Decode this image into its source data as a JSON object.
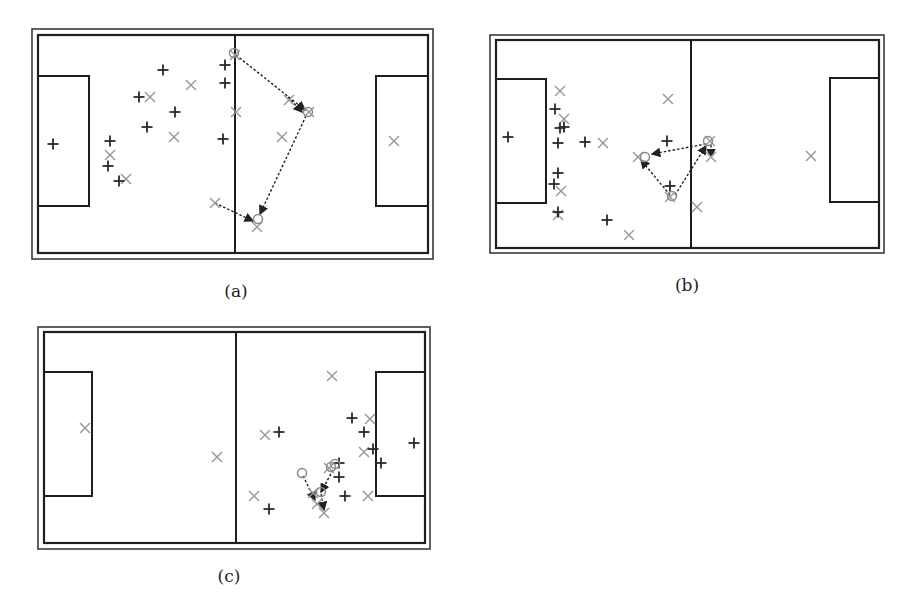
{
  "colors": {
    "frame": "#3a3a3a",
    "line": "#1e1e1e",
    "team_plus": "#2a2a2a",
    "team_x": "#9a9a9a",
    "ball_circle": "#8a8a8a",
    "arrow": "#222222"
  },
  "panels": [
    {
      "id": "a",
      "caption": "(a)",
      "caption_pos": [
        236,
        293
      ],
      "outer": [
        32,
        29,
        433,
        259
      ],
      "inner": [
        38,
        35,
        428,
        253
      ],
      "midline_x": 235,
      "left_box": [
        38,
        76,
        89,
        206
      ],
      "right_box": [
        376,
        76,
        428,
        206
      ],
      "plus": [
        [
          53,
          144
        ],
        [
          163,
          70
        ],
        [
          225,
          65
        ],
        [
          225,
          83
        ],
        [
          139,
          97
        ],
        [
          175,
          112
        ],
        [
          147,
          127
        ],
        [
          223,
          139
        ],
        [
          110,
          141
        ],
        [
          108,
          166
        ],
        [
          119,
          181
        ]
      ],
      "x": [
        [
          191,
          85
        ],
        [
          150,
          97
        ],
        [
          236,
          112
        ],
        [
          174,
          137
        ],
        [
          110,
          155
        ],
        [
          126,
          179
        ],
        [
          282,
          137
        ],
        [
          394,
          141
        ],
        [
          215,
          203
        ],
        [
          257,
          227
        ],
        [
          235,
          55
        ],
        [
          289,
          100
        ],
        [
          309,
          112
        ]
      ],
      "circles": [
        [
          234,
          53
        ],
        [
          308,
          112
        ],
        [
          258,
          219
        ]
      ],
      "arrows": [
        [
          [
            236,
            55
          ],
          [
            305,
            110
          ]
        ],
        [
          [
            288,
            97
          ],
          [
            302,
            112
          ]
        ],
        [
          [
            306,
            116
          ],
          [
            260,
            214
          ]
        ],
        [
          [
            215,
            203
          ],
          [
            253,
            221
          ]
        ]
      ]
    },
    {
      "id": "b",
      "caption": "(b)",
      "caption_pos": [
        687,
        287
      ],
      "outer": [
        490,
        35,
        884,
        253
      ],
      "inner": [
        496,
        40,
        879,
        248
      ],
      "midline_x": 691,
      "left_box": [
        496,
        79,
        546,
        203
      ],
      "right_box": [
        830,
        78,
        879,
        202
      ],
      "plus": [
        [
          508,
          137
        ],
        [
          555,
          109
        ],
        [
          560,
          128
        ],
        [
          564,
          127
        ],
        [
          558,
          143
        ],
        [
          585,
          142
        ],
        [
          558,
          173
        ],
        [
          554,
          184
        ],
        [
          558,
          212
        ],
        [
          607,
          220
        ],
        [
          667,
          141
        ],
        [
          670,
          186
        ]
      ],
      "x": [
        [
          560,
          91
        ],
        [
          564,
          119
        ],
        [
          603,
          143
        ],
        [
          561,
          191
        ],
        [
          558,
          215
        ],
        [
          629,
          235
        ],
        [
          668,
          99
        ],
        [
          638,
          157
        ],
        [
          670,
          197
        ],
        [
          697,
          207
        ],
        [
          710,
          141
        ],
        [
          711,
          157
        ],
        [
          811,
          156
        ]
      ],
      "circles": [
        [
          645,
          157
        ],
        [
          672,
          196
        ],
        [
          708,
          141
        ]
      ],
      "arrows": [
        [
          [
            706,
            144
          ],
          [
            652,
            154
          ]
        ],
        [
          [
            670,
            195
          ],
          [
            641,
            160
          ]
        ],
        [
          [
            675,
            195
          ],
          [
            706,
            146
          ]
        ],
        [
          [
            711,
            145
          ],
          [
            711,
            157
          ]
        ]
      ]
    },
    {
      "id": "c",
      "caption": "(c)",
      "caption_pos": [
        229,
        578
      ],
      "outer": [
        38,
        327,
        430,
        549
      ],
      "inner": [
        44,
        332,
        425,
        543
      ],
      "midline_x": 236,
      "left_box": [
        44,
        372,
        92,
        496
      ],
      "right_box": [
        376,
        372,
        425,
        496
      ],
      "plus": [
        [
          279,
          432
        ],
        [
          352,
          418
        ],
        [
          364,
          432
        ],
        [
          373,
          449
        ],
        [
          414,
          443
        ],
        [
          381,
          463
        ],
        [
          339,
          463
        ],
        [
          339,
          477
        ],
        [
          345,
          496
        ],
        [
          269,
          509
        ]
      ],
      "x": [
        [
          85,
          428
        ],
        [
          217,
          457
        ],
        [
          332,
          376
        ],
        [
          265,
          435
        ],
        [
          370,
          419
        ],
        [
          364,
          452
        ],
        [
          254,
          496
        ],
        [
          368,
          496
        ],
        [
          313,
          493
        ],
        [
          317,
          504
        ],
        [
          324,
          513
        ],
        [
          329,
          468
        ]
      ],
      "circles": [
        [
          302,
          473
        ],
        [
          321,
          492
        ],
        [
          331,
          467
        ],
        [
          335,
          464
        ]
      ],
      "arrows": [
        [
          [
            303,
            476
          ],
          [
            315,
            500
          ]
        ],
        [
          [
            333,
            470
          ],
          [
            321,
            492
          ]
        ],
        [
          [
            321,
            494
          ],
          [
            324,
            510
          ]
        ]
      ]
    }
  ]
}
